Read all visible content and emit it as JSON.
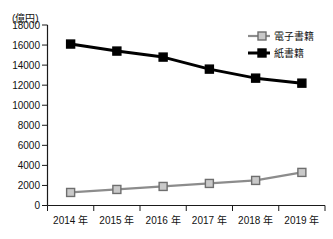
{
  "chart_data": {
    "type": "line",
    "title": "",
    "faint_header_text": "",
    "unit_label": "(億円)",
    "xlabel": "",
    "ylabel": "",
    "categories": [
      "2014 年",
      "2015 年",
      "2016 年",
      "2017 年",
      "2018 年",
      "2019 年"
    ],
    "x_values": [
      2014,
      2015,
      2016,
      2017,
      2018,
      2019
    ],
    "ylim": [
      0,
      18000
    ],
    "y_ticks": [
      0,
      2000,
      4000,
      6000,
      8000,
      10000,
      12000,
      14000,
      16000,
      18000
    ],
    "y_tick_labels": [
      "0",
      "2000",
      "4000",
      "6000",
      "8000",
      "10000",
      "12000",
      "14000",
      "16000",
      "18000"
    ],
    "grid": false,
    "legend_position": "top-right",
    "series": [
      {
        "name": "電子書籍",
        "values": [
          1300,
          1600,
          1900,
          2200,
          2500,
          3300
        ],
        "color": "#8c8c8c",
        "marker": "square",
        "marker_fill": "#c9c9c9",
        "marker_stroke": "#6e6e6e"
      },
      {
        "name": "紙書籍",
        "values": [
          16100,
          15400,
          14800,
          13600,
          12700,
          12200
        ],
        "color": "#000000",
        "marker": "square",
        "marker_fill": "#000000",
        "marker_stroke": "#000000"
      }
    ]
  },
  "legend": {
    "items": [
      {
        "label": "電子書籍",
        "swatch": "gray-square-marker"
      },
      {
        "label": "紙書籍",
        "swatch": "black-square-marker"
      }
    ]
  },
  "colors": {
    "background": "#ffffff",
    "axis": "#1a1a1a",
    "ebook_line": "#8c8c8c",
    "ebook_marker_fill": "#c9c9c9",
    "paper_line": "#000000"
  }
}
